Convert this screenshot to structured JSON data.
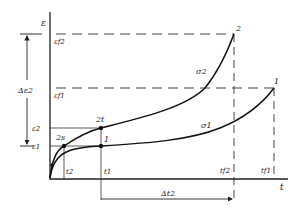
{
  "diagram": {
    "type": "creep-strain-vs-time",
    "axes": {
      "y_label": "ε",
      "x_label": "t"
    },
    "y_ticks": [
      {
        "id": "ef2",
        "label": "εf2",
        "y": 34
      },
      {
        "id": "ef1",
        "label": "εf1",
        "y": 88
      },
      {
        "id": "e2",
        "label": "ε2",
        "y": 128
      },
      {
        "id": "e1",
        "label": "ε1",
        "y": 146
      }
    ],
    "x_ticks": [
      {
        "id": "t2",
        "label": "t2",
        "x": 64
      },
      {
        "id": "t1",
        "label": "t1",
        "x": 101
      },
      {
        "id": "tf2",
        "label": "tf2",
        "x": 234
      },
      {
        "id": "tf1",
        "label": "tf1",
        "x": 274
      }
    ],
    "curves": [
      {
        "id": "sigma2",
        "label": "σ2",
        "end_point": "2"
      },
      {
        "id": "sigma1",
        "label": "σ1",
        "end_point": "1"
      }
    ],
    "points": [
      {
        "id": "2s",
        "label": "2s"
      },
      {
        "id": "2t",
        "label": "2t"
      },
      {
        "id": "1",
        "label": "1"
      },
      {
        "id": "end2",
        "label": "2"
      },
      {
        "id": "end1",
        "label": "1"
      }
    ],
    "annotations": {
      "delta_e2": "Δε2",
      "delta_t2": "Δt2"
    }
  }
}
